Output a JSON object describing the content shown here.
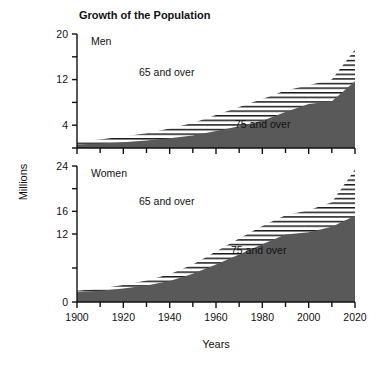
{
  "chart_data": {
    "type": "area",
    "title": "Growth of the Population",
    "xlabel": "Years",
    "ylabel": "Millions",
    "grid": false,
    "legend_position": "inline-annotations",
    "x": [
      1900,
      1910,
      1920,
      1930,
      1940,
      1950,
      1960,
      1970,
      1980,
      1990,
      2000,
      2010,
      2020
    ],
    "xlim": [
      1900,
      2020
    ],
    "xticks": [
      1900,
      1920,
      1940,
      1960,
      1980,
      2000,
      2020
    ],
    "xticklabels": [
      "1900",
      "1920",
      "1940",
      "1960",
      "1980",
      "2000",
      "2020"
    ],
    "xminor_ticks": [
      1910,
      1930,
      1950,
      1970,
      1990,
      2010
    ],
    "panels": [
      {
        "name": "men",
        "label": "Men",
        "ylim": [
          0,
          20
        ],
        "yticks": [
          0,
          4,
          8,
          12,
          16,
          20
        ],
        "yticklabels": [
          "",
          "4",
          "",
          "12",
          "",
          "20"
        ],
        "series": [
          {
            "name": "75 and over",
            "label": "75 and over",
            "style": "solid-gray",
            "values": [
              0.6,
              0.8,
              1.0,
              1.3,
              1.7,
              2.2,
              3.0,
              3.8,
              4.8,
              6.3,
              7.7,
              8.2,
              11.7
            ]
          },
          {
            "name": "65 and over",
            "label": "65 and over",
            "style": "horizontal-hatch",
            "values": [
              1.2,
              1.5,
              2.0,
              2.6,
              3.4,
              4.4,
              5.8,
              7.2,
              8.6,
              10.1,
              11.0,
              12.0,
              17.3
            ]
          }
        ]
      },
      {
        "name": "women",
        "label": "Women",
        "ylim": [
          0,
          24
        ],
        "yticks": [
          0,
          6,
          12,
          16,
          20,
          24
        ],
        "yticklabels": [
          "0",
          "",
          "12",
          "16",
          "",
          "24"
        ],
        "series": [
          {
            "name": "75 and over",
            "label": "75 and over",
            "style": "solid-gray",
            "values": [
              1.7,
              2.0,
              2.4,
              2.9,
              3.7,
              5.0,
              6.6,
              8.4,
              10.2,
              11.9,
              12.3,
              13.3,
              15.2
            ]
          },
          {
            "name": "65 and over",
            "label": "65 and over",
            "style": "horizontal-hatch",
            "values": [
              2.0,
              2.4,
              3.0,
              3.8,
              4.9,
              6.6,
              8.9,
              11.2,
              13.4,
              15.3,
              16.2,
              17.6,
              23.4
            ]
          }
        ]
      }
    ],
    "colors": {
      "solid_fill": "#595959",
      "hatch_line": "#1a1a1a",
      "axis": "#111111",
      "background": "#ffffff"
    }
  }
}
